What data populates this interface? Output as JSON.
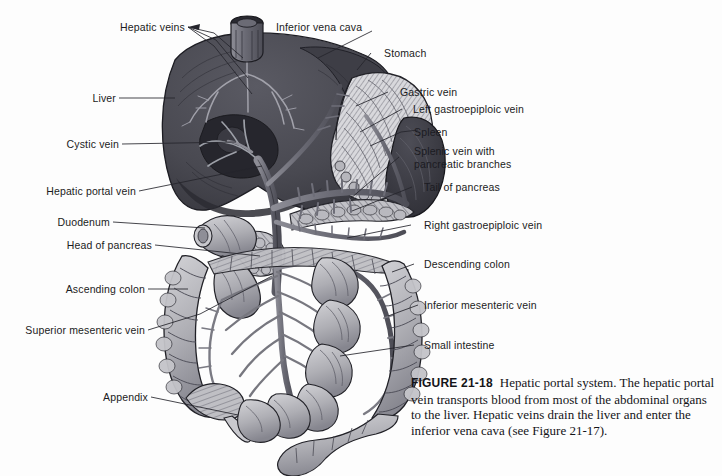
{
  "figure": {
    "number": "FIGURE 21-18",
    "caption": "Hepatic portal system. The hepatic portal vein transports blood from most of the abdominal organs to the liver. Hepatic veins drain the liver and enter the inferior vena cava (see Figure 21-17)."
  },
  "colors": {
    "background": "#fdfdfd",
    "ink": "#1b1b22",
    "liver": "#4a4a52",
    "spleen": "#3d3d45",
    "stomach": "#c9c9cc",
    "vessel": "#70707a",
    "intestine": "#b0b0b5",
    "leader": "#25252c"
  },
  "labels_left": [
    {
      "id": "hepatic-veins",
      "text": "Hepatic veins"
    },
    {
      "id": "liver",
      "text": "Liver"
    },
    {
      "id": "cystic-vein",
      "text": "Cystic vein"
    },
    {
      "id": "hepatic-portal-vein",
      "text": "Hepatic portal vein"
    },
    {
      "id": "duodenum",
      "text": "Duodenum"
    },
    {
      "id": "head-of-pancreas",
      "text": "Head of pancreas"
    },
    {
      "id": "ascending-colon",
      "text": "Ascending colon"
    },
    {
      "id": "superior-mesenteric-vein",
      "text": "Superior mesenteric vein"
    },
    {
      "id": "appendix",
      "text": "Appendix"
    }
  ],
  "labels_right": [
    {
      "id": "inferior-vena-cava",
      "text": "Inferior vena cava"
    },
    {
      "id": "stomach",
      "text": "Stomach"
    },
    {
      "id": "gastric-vein",
      "text": "Gastric vein"
    },
    {
      "id": "left-gastroepiploic-vein",
      "text": "Left gastroepiploic vein"
    },
    {
      "id": "spleen",
      "text": "Spleen"
    },
    {
      "id": "splenic-vein-line1",
      "text": "Splenic vein with"
    },
    {
      "id": "splenic-vein-line2",
      "text": "pancreatic branches"
    },
    {
      "id": "tail-of-pancreas",
      "text": "Tail of pancreas"
    },
    {
      "id": "right-gastroepiploic-vein",
      "text": "Right gastroepiploic vein"
    },
    {
      "id": "descending-colon",
      "text": "Descending colon"
    },
    {
      "id": "inferior-mesenteric-vein",
      "text": "Inferior mesenteric vein"
    },
    {
      "id": "small-intestine",
      "text": "Small intestine"
    }
  ]
}
